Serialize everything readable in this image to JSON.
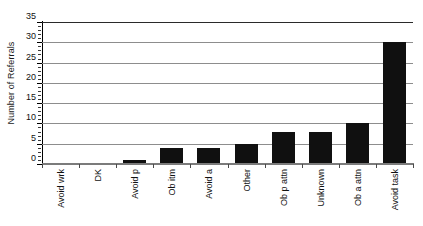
{
  "chart_data": {
    "type": "bar",
    "title": "",
    "xlabel": "",
    "ylabel": "Number of Referrals",
    "categories": [
      "Avoid wrk",
      "DK",
      "Avoid p",
      "Ob itm",
      "Avoid a",
      "Other",
      "Ob p attn",
      "Unknown",
      "Ob a attn",
      "Avoid task"
    ],
    "values": [
      0,
      0,
      1,
      4,
      4,
      5,
      8,
      8,
      10,
      30
    ],
    "ylim": [
      0,
      35
    ],
    "ytick_labels": [
      "0",
      "5",
      "10",
      "15",
      "20",
      "25",
      "30",
      "35"
    ],
    "ytick_values": [
      0,
      5,
      10,
      15,
      20,
      25,
      30,
      35
    ],
    "ytick_step": 5,
    "yminor_step": 1,
    "grid": true,
    "grid_axis": "y",
    "legend": false,
    "legend_position": "none",
    "bar_color": "#101010",
    "grid_color": "#8d8d8d",
    "axis_color": "#000000",
    "background_color": "#ffffff"
  }
}
